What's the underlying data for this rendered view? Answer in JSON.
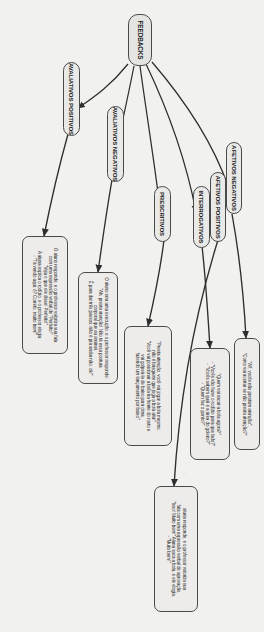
{
  "diagram": {
    "type": "mind-map",
    "orientation": "rotated-90",
    "language": "pt-BR",
    "root": {
      "label": "FEEDBACKS"
    },
    "categories": [
      {
        "id": "avaliativos-positivos",
        "label": "AVALIATIVOS POSITIVOS"
      },
      {
        "id": "avaliativos-negativos",
        "label": "AVALIATIVOS NEGATIVOS"
      },
      {
        "id": "prescritivos",
        "label": "PRESCRITIVOS"
      },
      {
        "id": "interrogativos",
        "label": "INTERROGATIVOS"
      },
      {
        "id": "afetivos-positivos",
        "label": "AFETIVOS POSITIVOS"
      },
      {
        "id": "afetivos-negativos",
        "label": "AFETIVOS NEGATIVOS"
      }
    ],
    "examples": [
      {
        "id": "ex-avaliativos-positivos",
        "category": "avaliativos-positivos",
        "lines": [
          "O aluno responde, e o professor valoriza sua fala",
          "com uma expressão verbal de \"Perfeito!\"",
          "\"Veja o que ele disse! Perfeito!\"",
          "A aluna explica o rodízio, e o professor elogia:",
          "- \"Tá vendo aqui, ó? Correto, muito bem!\""
        ]
      },
      {
        "id": "ex-avaliativos-negativos",
        "category": "avaliativos-negativos",
        "lines": [
          "O aluno erra uma execução, e o professor responde:",
          "\"Ah, presta atenção! Não tá essa postura",
          "corporal que eu ensinei.",
          "É para dar três passos, não é pra andar não, ok!\""
        ]
      },
      {
        "id": "ex-prescritivos",
        "category": "prescritivos",
        "lines": [
          "\"Presta atenção, você vai jogar a bola mesmo,",
          "não é basquete que joga a bola alta!\"",
          "\"Você vai posicionar a bola na frente do rosto e",
          "vai golpeá-la de baixo para cima,",
          "fazendo um lançamento por baixo\""
        ]
      },
      {
        "id": "ex-interrogativos",
        "category": "interrogativos",
        "lines": [
          "\"Quem vai sacar a bola agora?\"",
          "- \"Vocês vão fazer o rodízio para que lado?\"",
          "- \"Vocês sabem qual é a área do goleiro?\"",
          "- \"Quem faz o ponto?\""
        ]
      },
      {
        "id": "ex-afetivos-positivos",
        "category": "afetivos-positivos",
        "lines": [
          "aluna responde, e o professor valoriza sua",
          "fala com uma expressão verbal de aprovação.",
          "\"Isso! Muito bem!\" Aluna saca a bola, e ele elogia.",
          "- \"Muito bem!\""
        ]
      },
      {
        "id": "ex-afetivos-negativos",
        "category": "afetivos-negativos",
        "lines": [
          "\"Aff, vocês não prestam atenção\".",
          "\"Como vai acertar se não presta atenção?\""
        ]
      }
    ],
    "style": {
      "stroke": "#3a3a3a",
      "node_fill": "#ececeb",
      "page_bg": "#f1f1ef"
    }
  }
}
